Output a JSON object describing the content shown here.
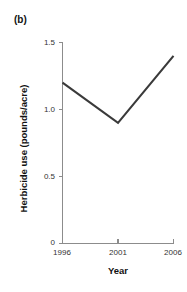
{
  "figure": {
    "panel_label": "(b)",
    "background_color": "#ffffff"
  },
  "chart_data": {
    "type": "line",
    "title": "",
    "subtitle": "",
    "panel": "(b)",
    "xlabel": "Year",
    "ylabel": "Herbicide use (pounds/acre)",
    "x": [
      1996,
      2001,
      2006
    ],
    "values": [
      1.2,
      0.9,
      1.4
    ],
    "series": [
      {
        "name": "Herbicide use",
        "values": [
          1.2,
          0.9,
          1.4
        ],
        "color": "#3a3a3a"
      }
    ],
    "xlim": [
      1996,
      2006
    ],
    "ylim": [
      0,
      1.5
    ],
    "xticks": [
      1996,
      2001,
      2006
    ],
    "xticklabels": [
      "1996",
      "2001",
      "2006"
    ],
    "yticks": [
      0,
      0.5,
      1.0,
      1.5
    ],
    "yticklabels": [
      "0",
      "0.5",
      "1.0",
      "1.5"
    ],
    "grid": false,
    "legend": false,
    "legend_position": "none",
    "line_color": "#3a3a3a",
    "axis_color": "#8c8c8c",
    "markers": false
  },
  "axis_labels": {
    "y_tick_0": "0",
    "y_tick_1": "0.5",
    "y_tick_2": "1.0",
    "y_tick_3": "1.5",
    "x_tick_0": "1996",
    "x_tick_1": "2001",
    "x_tick_2": "2006",
    "x_title": "Year",
    "y_title": "Herbicide use (pounds/acre)"
  }
}
